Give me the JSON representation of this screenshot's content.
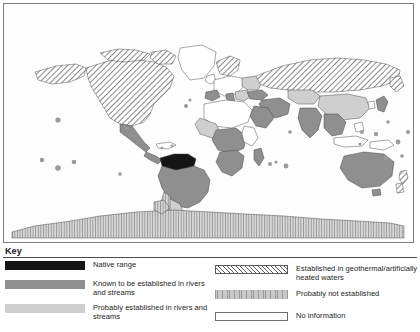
{
  "figure": {
    "panel_label": "(b)",
    "type": "world distribution map"
  },
  "legend": {
    "title": "Key",
    "columns": [
      {
        "name": "left",
        "items": [
          {
            "swatch": "native-range-swatch",
            "style": "solid-black",
            "color": "#151515",
            "label": "Native range"
          },
          {
            "swatch": "known-established-swatch",
            "style": "solid-mid-gray",
            "color": "#8f8f8f",
            "label": "Known to be established in rivers and streams"
          },
          {
            "swatch": "probably-established-swatch",
            "style": "solid-light-gray",
            "color": "#cfcfcf",
            "label": "Probably established in rivers and streams"
          }
        ]
      },
      {
        "name": "right",
        "items": [
          {
            "swatch": "geothermal-swatch",
            "style": "diagonal-hatch",
            "color": "#5e5e5e",
            "label": "Established in geothermal/artificially heated waters"
          },
          {
            "swatch": "probably-not-established-swatch",
            "style": "vertical-hatch-gray",
            "color": "#c8c8c8",
            "label": "Probably not established"
          },
          {
            "swatch": "no-information-swatch",
            "style": "outline-white",
            "color": "#ffffff",
            "label": "No information"
          }
        ]
      }
    ]
  },
  "map_regions": {
    "native_range": [
      "Colombia",
      "Venezuela",
      "southern Chile coast"
    ],
    "known_established": [
      "Brazil",
      "Australia",
      "India",
      "Japan",
      "South Africa",
      "Madagascar",
      "Central Africa",
      "Saudi Arabia",
      "Mexico",
      "Central America",
      "Iran",
      "Myanmar"
    ],
    "probably_established": [
      "Argentina",
      "Chile",
      "Kazakhstan",
      "Mongolia",
      "parts of West Africa",
      "parts of Eastern Europe"
    ],
    "geothermal": [
      "United States",
      "Canada",
      "Russia",
      "Scandinavia",
      "New Zealand"
    ],
    "probably_not_established": [
      "Antarctica"
    ],
    "no_information": [
      "Greenland",
      "Sahara region",
      "Papua New Guinea",
      "various small states"
    ]
  },
  "ghost_text": "A distribution of the species is shown across the globe in relation to recorded occurrence and the likely status of populations in each territory"
}
